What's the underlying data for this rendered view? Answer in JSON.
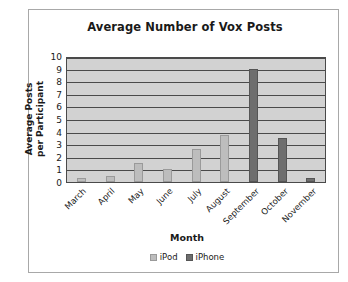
{
  "chart_data": {
    "type": "bar",
    "title": "Average Number of Vox Posts",
    "xlabel": "Month",
    "ylabel": "Average Posts\nper Participant",
    "ylabel_line1": "Average Posts",
    "ylabel_line2": "per Participant",
    "categories": [
      "March",
      "April",
      "May",
      "June",
      "July",
      "August",
      "September",
      "October",
      "November"
    ],
    "series": [
      {
        "name": "iPod",
        "color": "#bdbdbd",
        "values": [
          0.3,
          0.5,
          1.5,
          1.0,
          2.6,
          3.7,
          0,
          0,
          0
        ]
      },
      {
        "name": "iPhone",
        "color": "#6e6e6e",
        "values": [
          0,
          0,
          0,
          0,
          0,
          0,
          9.0,
          3.5,
          0.3
        ]
      }
    ],
    "ylim": [
      0,
      10
    ],
    "yticks": [
      10,
      9,
      8,
      7,
      6,
      5,
      4,
      3,
      2,
      1,
      0
    ],
    "grid": true,
    "legend_position": "bottom"
  }
}
